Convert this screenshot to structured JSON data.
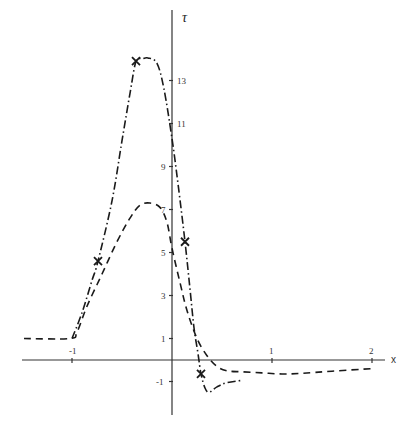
{
  "chart_data": {
    "type": "line",
    "title": "",
    "xlabel": "x",
    "ylabel": "τ",
    "xlim": [
      -1.5,
      2.2
    ],
    "ylim": [
      -2,
      15
    ],
    "grid": false,
    "legend": null,
    "x_ticks": [
      -1,
      1,
      2
    ],
    "x_tick_labels": [
      "-1",
      "1",
      "2"
    ],
    "y_ticks": [
      -1,
      1,
      3,
      5,
      7,
      9,
      11,
      13
    ],
    "y_tick_labels": [
      "-1",
      "1",
      "3",
      "5",
      "7",
      "9",
      "11",
      "13"
    ],
    "series": [
      {
        "name": "dash-dot curve",
        "style": "dash-dot",
        "points": [
          [
            -1.0,
            1.0
          ],
          [
            -0.9,
            2.2
          ],
          [
            -0.8,
            3.7
          ],
          [
            -0.74,
            4.6
          ],
          [
            -0.6,
            7.4
          ],
          [
            -0.5,
            10.2
          ],
          [
            -0.42,
            12.4
          ],
          [
            -0.36,
            13.9
          ],
          [
            -0.3,
            14.0
          ],
          [
            -0.24,
            14.05
          ],
          [
            -0.15,
            13.8
          ],
          [
            -0.08,
            12.6
          ],
          [
            0.0,
            10.3
          ],
          [
            0.06,
            8.2
          ],
          [
            0.13,
            5.5
          ],
          [
            0.18,
            3.3
          ],
          [
            0.22,
            1.5
          ],
          [
            0.26,
            0.3
          ],
          [
            0.29,
            -0.65
          ],
          [
            0.33,
            -1.3
          ],
          [
            0.37,
            -1.5
          ],
          [
            0.45,
            -1.25
          ],
          [
            0.55,
            -1.05
          ],
          [
            0.7,
            -0.95
          ]
        ],
        "markers": [
          [
            -0.74,
            4.6
          ],
          [
            -0.36,
            13.9
          ],
          [
            0.13,
            5.5
          ],
          [
            0.29,
            -0.65
          ]
        ]
      },
      {
        "name": "dashed curve",
        "style": "dashed",
        "points": [
          [
            -1.48,
            1.0
          ],
          [
            -1.02,
            1.0
          ],
          [
            -0.95,
            1.3
          ],
          [
            -0.85,
            2.5
          ],
          [
            -0.7,
            4.0
          ],
          [
            -0.55,
            5.5
          ],
          [
            -0.42,
            6.6
          ],
          [
            -0.32,
            7.2
          ],
          [
            -0.22,
            7.3
          ],
          [
            -0.12,
            7.1
          ],
          [
            -0.05,
            6.4
          ],
          [
            0.0,
            5.2
          ],
          [
            0.08,
            3.6
          ],
          [
            0.15,
            2.3
          ],
          [
            0.25,
            1.0
          ],
          [
            0.35,
            0.2
          ],
          [
            0.45,
            -0.3
          ],
          [
            0.55,
            -0.5
          ],
          [
            0.7,
            -0.55
          ],
          [
            0.9,
            -0.6
          ],
          [
            1.1,
            -0.65
          ],
          [
            1.3,
            -0.62
          ],
          [
            1.6,
            -0.52
          ],
          [
            2.0,
            -0.4
          ]
        ]
      }
    ]
  },
  "axis": {
    "x_name": "x",
    "y_name": "τ",
    "x_tick_labels": [
      "-1",
      "1",
      "2"
    ],
    "y_tick_labels": [
      "-1",
      "1",
      "3",
      "5",
      "7",
      "9",
      "11",
      "13"
    ]
  },
  "colors": {
    "line": "#1a1a1a",
    "axis": "#333333",
    "background": "#ffffff"
  }
}
